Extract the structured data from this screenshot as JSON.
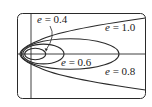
{
  "diagram": {
    "title": "",
    "type": "conic sections with common focus and directrix",
    "colors": {
      "stroke": "#2a2a2a",
      "background": "#ffffff"
    },
    "curves": [
      {
        "id": "e04",
        "eccentricity": 0.4,
        "kind": "ellipse"
      },
      {
        "id": "e06",
        "eccentricity": 0.6,
        "kind": "ellipse"
      },
      {
        "id": "e08",
        "eccentricity": 0.8,
        "kind": "ellipse"
      },
      {
        "id": "e10",
        "eccentricity": 1.0,
        "kind": "parabola"
      }
    ],
    "labels": {
      "e04": {
        "var": "e",
        "eq": " = 0.4"
      },
      "e06": {
        "var": "e",
        "eq": " = 0.6"
      },
      "e08": {
        "var": "e",
        "eq": " = 0.8"
      },
      "e10": {
        "var": "e",
        "eq": " = 1.0"
      }
    }
  }
}
